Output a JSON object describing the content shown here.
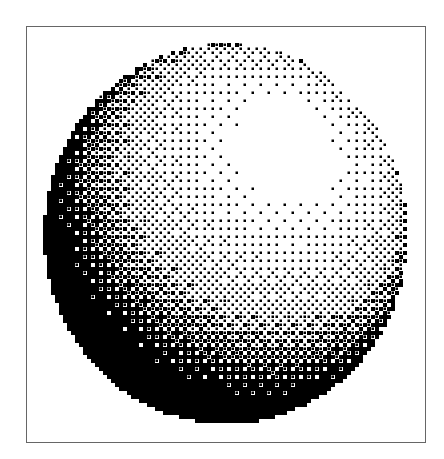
{
  "figure": {
    "frame": {
      "x": 26,
      "y": 26,
      "width": 400,
      "height": 417,
      "stroke": "#666666"
    },
    "sphere": {
      "center_x": 226,
      "center_y": 234,
      "radius_x": 182,
      "radius_y": 190,
      "highlight_center_x": 287,
      "highlight_center_y": 148,
      "foreground": "#000000",
      "background": "#ffffff",
      "dither": "ordered-bayer-4x4",
      "cell_size": 4
    }
  }
}
